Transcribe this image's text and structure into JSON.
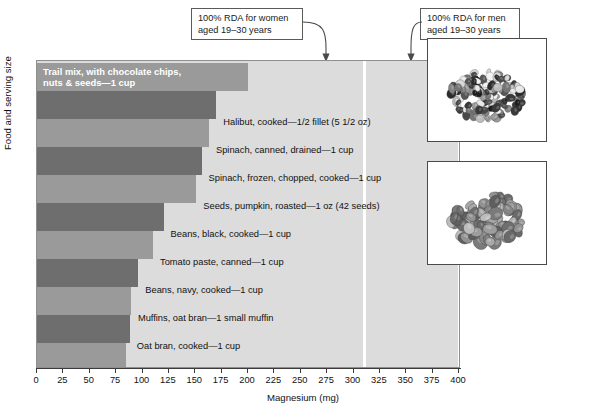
{
  "chart_data": {
    "type": "bar",
    "orientation": "horizontal",
    "title": "",
    "xlabel": "Magnesium (mg)",
    "ylabel": "Food and serving size",
    "xlim": [
      0,
      400
    ],
    "xticks": [
      0,
      25,
      50,
      75,
      100,
      125,
      150,
      175,
      200,
      225,
      250,
      275,
      300,
      325,
      350,
      375,
      400
    ],
    "grid": false,
    "legend": "none",
    "categories": [
      "Trail mix, with chocolate chips, nuts & seeds—1 cup",
      "Halibut, cooked—1/2 fillet (5 1/2 oz)",
      "Spinach, canned, drained—1 cup",
      "Spinach, frozen, chopped, cooked—1 cup",
      "Seeds, pumpkin, roasted—1 oz (42 seeds)",
      "Beans, black, cooked—1 cup",
      "Tomato paste, canned—1 cup",
      "Beans, navy, cooked—1 cup",
      "Muffins, oat bran—1 small muffin",
      "Oat bran, cooked—1 cup",
      "Rice, brown, cooked—1 cup"
    ],
    "values": [
      200,
      170,
      163,
      156,
      151,
      120,
      110,
      96,
      89,
      88,
      84
    ],
    "annotations": [
      {
        "label": "100% RDA for women\naged 19–30 years",
        "value": 310
      },
      {
        "label": "100% RDA for men\naged 19–30 years",
        "value": 400
      }
    ]
  },
  "callouts": {
    "women": "100% RDA for women\naged 19–30 years",
    "men": "100% RDA for men\naged 19–30 years"
  },
  "axes": {
    "x_title": "Magnesium (mg)",
    "y_title": "Food and serving size",
    "x_tick_labels": [
      "0",
      "25",
      "50",
      "75",
      "100",
      "125",
      "150",
      "175",
      "200",
      "225",
      "250",
      "275",
      "300",
      "325",
      "350",
      "375",
      "400"
    ]
  },
  "bars": [
    {
      "label": "Trail mix, with chocolate chips,\nnuts & seeds—1 cup",
      "value": 200,
      "shade": "mid",
      "label_position": "inside"
    },
    {
      "label": "Halibut, cooked—1/2 fillet (5 1/2 oz)",
      "value": 170,
      "shade": "dark",
      "label_position": "outside"
    },
    {
      "label": "Spinach, canned, drained—1 cup",
      "value": 163,
      "shade": "mid",
      "label_position": "outside"
    },
    {
      "label": "Spinach, frozen, chopped, cooked—1 cup",
      "value": 156,
      "shade": "dark",
      "label_position": "outside"
    },
    {
      "label": "Seeds, pumpkin, roasted—1 oz (42 seeds)",
      "value": 151,
      "shade": "mid",
      "label_position": "outside"
    },
    {
      "label": "Beans, black, cooked—1 cup",
      "value": 120,
      "shade": "dark",
      "label_position": "outside"
    },
    {
      "label": "Tomato paste, canned—1 cup",
      "value": 110,
      "shade": "mid",
      "label_position": "outside"
    },
    {
      "label": "Beans, navy, cooked—1 cup",
      "value": 96,
      "shade": "dark",
      "label_position": "outside"
    },
    {
      "label": "Muffins, oat bran—1 small muffin",
      "value": 89,
      "shade": "mid",
      "label_position": "outside"
    },
    {
      "label": "Oat bran, cooked—1 cup",
      "value": 88,
      "shade": "dark",
      "label_position": "outside"
    },
    {
      "label": "Rice, brown, cooked—1 cup",
      "value": 84,
      "shade": "mid",
      "label_position": "outside"
    }
  ],
  "photos": [
    {
      "name": "trail-mix-photo",
      "caption": ""
    },
    {
      "name": "pumpkin-seeds-photo",
      "caption": ""
    }
  ],
  "colors": {
    "plot_background": "#dcdcdc",
    "bar_dark": "#6e6e6e",
    "bar_mid": "#9a9a9a",
    "rda_line": "#ffffff",
    "axis": "#3b3b3b",
    "text": "#111111"
  }
}
